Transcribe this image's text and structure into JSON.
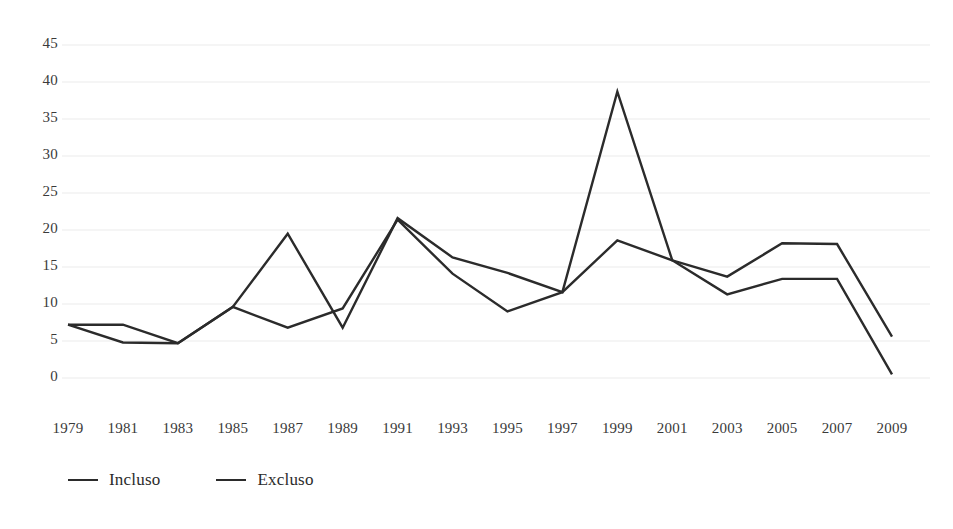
{
  "chart_data": {
    "type": "line",
    "title": "",
    "xlabel": "",
    "ylabel": "",
    "categories": [
      "1979",
      "1981",
      "1983",
      "1985",
      "1987",
      "1989",
      "1991",
      "1993",
      "1995",
      "1997",
      "1999",
      "2001",
      "2003",
      "2005",
      "2007",
      "2009"
    ],
    "ylim": [
      0,
      45
    ],
    "yticks": [
      0,
      5,
      10,
      15,
      20,
      25,
      30,
      35,
      40,
      45
    ],
    "ytick_labels": [
      "0",
      "5",
      "10",
      "15",
      "20",
      "25",
      "30",
      "35",
      "40",
      "45"
    ],
    "grid": true,
    "grid_color": "#ebebeb",
    "legend_position": "bottom-left",
    "series": [
      {
        "name": "Incluso",
        "color": "#2b2b2b",
        "values": [
          7.2,
          7.2,
          4.7,
          9.6,
          19.5,
          6.8,
          21.6,
          16.3,
          14.2,
          11.6,
          38.7,
          15.9,
          13.7,
          18.2,
          18.1,
          5.6
        ]
      },
      {
        "name": "Excluso",
        "color": "#2b2b2b",
        "values": [
          7.2,
          4.8,
          4.7,
          9.6,
          6.8,
          9.4,
          21.4,
          14.1,
          9.0,
          11.6,
          18.6,
          15.9,
          11.3,
          13.4,
          13.4,
          0.5
        ]
      }
    ]
  },
  "legend": {
    "items": [
      {
        "label": "Incluso"
      },
      {
        "label": "Excluso"
      }
    ]
  }
}
